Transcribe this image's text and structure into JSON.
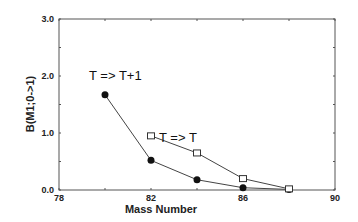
{
  "chart_data": {
    "type": "line",
    "title": "",
    "xlabel": "Mass Number",
    "ylabel": "B(M1;0->1)",
    "xlim": [
      78,
      90
    ],
    "ylim": [
      0.0,
      3.0
    ],
    "x_ticks": [
      "78",
      "82",
      "86",
      "90"
    ],
    "y_ticks": [
      "0.0",
      "1.0",
      "2.0",
      "3.0"
    ],
    "grid": false,
    "series": [
      {
        "name": "T => T+1",
        "marker": "filled-circle",
        "x": [
          80,
          82,
          84,
          86,
          88
        ],
        "values": [
          1.67,
          0.52,
          0.18,
          0.04,
          0.01
        ]
      },
      {
        "name": "T => T",
        "marker": "open-square",
        "x": [
          82,
          84,
          86,
          88
        ],
        "values": [
          0.95,
          0.65,
          0.2,
          0.02
        ]
      }
    ],
    "annotations": [
      {
        "text": "T => T+1",
        "x": 80,
        "y": 2.0
      },
      {
        "text": "T => T",
        "x": 82.3,
        "y": 1.05
      }
    ]
  }
}
